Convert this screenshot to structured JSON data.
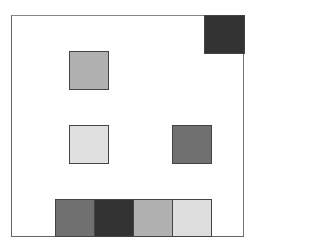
{
  "diagram": {
    "frame": {
      "left": 11,
      "top": 15,
      "width": 233,
      "height": 222
    },
    "squares": [
      {
        "id": "top-right",
        "left": 204,
        "top": 15,
        "width": 41,
        "height": 39,
        "color": "#333333"
      },
      {
        "id": "upper-left",
        "left": 69,
        "top": 51,
        "width": 40,
        "height": 39,
        "color": "#b0b0b0"
      },
      {
        "id": "middle-left",
        "left": 69,
        "top": 125,
        "width": 40,
        "height": 39,
        "color": "#e0e0e0"
      },
      {
        "id": "middle-right",
        "left": 172,
        "top": 125,
        "width": 40,
        "height": 39,
        "color": "#707070"
      }
    ],
    "bottom_row": [
      {
        "id": "bottom-1",
        "left": 55,
        "top": 199,
        "width": 40,
        "height": 38,
        "color": "#707070"
      },
      {
        "id": "bottom-2",
        "left": 94,
        "top": 199,
        "width": 40,
        "height": 38,
        "color": "#333333"
      },
      {
        "id": "bottom-3",
        "left": 133,
        "top": 199,
        "width": 40,
        "height": 38,
        "color": "#b0b0b0"
      },
      {
        "id": "bottom-4",
        "left": 172,
        "top": 199,
        "width": 40,
        "height": 38,
        "color": "#dedede"
      }
    ]
  }
}
